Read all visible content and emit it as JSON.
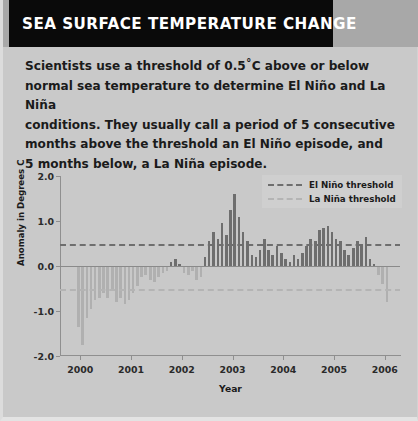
{
  "header": {
    "title": "SEA SURFACE TEMPERATURE CHANGE",
    "title_bg": "#0a0a0a",
    "title_color": "#ffffff",
    "band_bg": "#a8a8a8"
  },
  "intro": {
    "line1": "Scientists use a threshold of 0.5˚C above or below",
    "line2": "normal sea temperature to determine El Niño and La Niña",
    "line3": "conditions. They usually call a period of 5 consecutive",
    "line4": "months above the threshold an El Niño episode, and",
    "line5": "5 months below, a La Niña episode."
  },
  "chart_data": {
    "type": "bar",
    "title": "",
    "xlabel": "Year",
    "ylabel": "Anomaly in Degrees C",
    "ylim": [
      -2.0,
      2.0
    ],
    "xlim": [
      1999.6,
      2006.3
    ],
    "yticks": [
      "-2.0",
      "-1.0",
      "0.0",
      "1.0",
      "2.0"
    ],
    "ytick_values": [
      -2.0,
      -1.0,
      0.0,
      1.0,
      2.0
    ],
    "xticks": [
      "2000",
      "2001",
      "2002",
      "2003",
      "2004",
      "2005",
      "2006"
    ],
    "xtick_values": [
      2000,
      2001,
      2002,
      2003,
      2004,
      2005,
      2006
    ],
    "grid": false,
    "legend_position": "top-right",
    "bar_color_positive": "#6e6e6e",
    "bar_color_negative": "#b0b0b0",
    "plot_bg": "#c9c9c9",
    "legend": [
      {
        "label": "El Niño threshold",
        "color": "#6e6e6e",
        "style": "dashed",
        "value": 0.5
      },
      {
        "label": "La Niña threshold",
        "color": "#b4b4b4",
        "style": "dashed",
        "value": -0.5
      }
    ],
    "thresholds": [
      {
        "name": "El Niño threshold",
        "value": 0.5,
        "color": "#6e6e6e"
      },
      {
        "name": "La Niña threshold",
        "value": -0.5,
        "color": "#b4b4b4"
      }
    ],
    "x": [
      1999.96,
      2000.04,
      2000.13,
      2000.21,
      2000.29,
      2000.38,
      2000.46,
      2000.54,
      2000.63,
      2000.71,
      2000.79,
      2000.88,
      2000.96,
      2001.04,
      2001.13,
      2001.21,
      2001.29,
      2001.38,
      2001.46,
      2001.54,
      2001.63,
      2001.71,
      2001.79,
      2001.88,
      2001.96,
      2002.04,
      2002.13,
      2002.21,
      2002.29,
      2002.38,
      2002.46,
      2002.54,
      2002.63,
      2002.71,
      2002.79,
      2002.88,
      2002.96,
      2003.04,
      2003.13,
      2003.21,
      2003.29,
      2003.38,
      2003.46,
      2003.54,
      2003.63,
      2003.71,
      2003.79,
      2003.88,
      2003.96,
      2004.04,
      2004.13,
      2004.21,
      2004.29,
      2004.38,
      2004.46,
      2004.54,
      2004.63,
      2004.71,
      2004.79,
      2004.88,
      2004.96,
      2005.04,
      2005.13,
      2005.21,
      2005.29,
      2005.38,
      2005.46,
      2005.54,
      2005.63,
      2005.71,
      2005.79,
      2005.88,
      2005.96,
      2006.04
    ],
    "values": [
      -1.35,
      -1.75,
      -1.15,
      -0.95,
      -0.75,
      -0.7,
      -0.6,
      -0.7,
      -0.55,
      -0.8,
      -0.7,
      -0.85,
      -0.75,
      -0.6,
      -0.45,
      -0.25,
      -0.2,
      -0.3,
      -0.35,
      -0.25,
      -0.15,
      -0.1,
      0.1,
      0.15,
      0.05,
      -0.15,
      -0.2,
      -0.1,
      -0.3,
      -0.25,
      0.2,
      0.55,
      0.75,
      0.6,
      0.95,
      0.7,
      1.25,
      1.6,
      1.1,
      0.75,
      0.55,
      0.25,
      0.2,
      0.35,
      0.6,
      0.35,
      0.25,
      0.45,
      0.3,
      0.15,
      0.1,
      0.25,
      0.15,
      0.3,
      0.45,
      0.6,
      0.55,
      0.8,
      0.85,
      0.9,
      0.75,
      0.6,
      0.55,
      0.35,
      0.25,
      0.4,
      0.55,
      0.5,
      0.65,
      0.15,
      0.05,
      -0.2,
      -0.4,
      -0.8
    ],
    "series": [
      {
        "name": "Sea surface temperature anomaly",
        "values": [
          -1.35,
          -1.75,
          -1.15,
          -0.95,
          -0.75,
          -0.7,
          -0.6,
          -0.7,
          -0.55,
          -0.8,
          -0.7,
          -0.85,
          -0.75,
          -0.6,
          -0.45,
          -0.25,
          -0.2,
          -0.3,
          -0.35,
          -0.25,
          -0.15,
          -0.1,
          0.1,
          0.15,
          0.05,
          -0.15,
          -0.2,
          -0.1,
          -0.3,
          -0.25,
          0.2,
          0.55,
          0.75,
          0.6,
          0.95,
          0.7,
          1.25,
          1.6,
          1.1,
          0.75,
          0.55,
          0.25,
          0.2,
          0.35,
          0.6,
          0.35,
          0.25,
          0.45,
          0.3,
          0.15,
          0.1,
          0.25,
          0.15,
          0.3,
          0.45,
          0.6,
          0.55,
          0.8,
          0.85,
          0.9,
          0.75,
          0.6,
          0.55,
          0.35,
          0.25,
          0.4,
          0.55,
          0.5,
          0.65,
          0.15,
          0.05,
          -0.2,
          -0.4,
          -0.8
        ]
      }
    ]
  }
}
